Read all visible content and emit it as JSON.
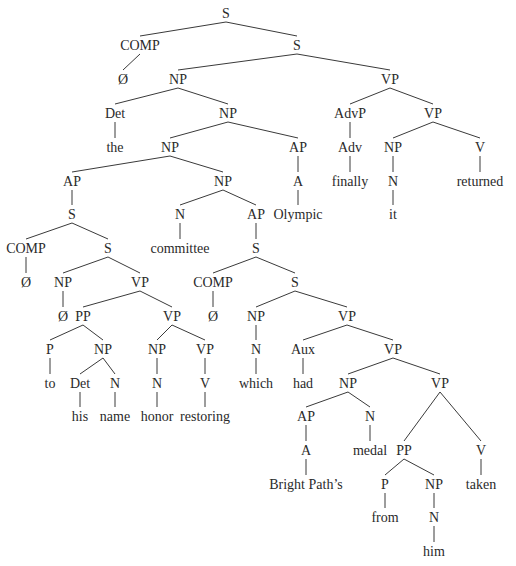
{
  "diagram": {
    "type": "syntax-tree",
    "nodes": [
      {
        "id": "n0",
        "label": "S",
        "x": 226,
        "y": 18
      },
      {
        "id": "n1",
        "label": "COMP",
        "x": 140,
        "y": 50,
        "parent": "n0"
      },
      {
        "id": "n2",
        "label": "Ø",
        "x": 123,
        "y": 84,
        "parent": "n1"
      },
      {
        "id": "n3",
        "label": "S",
        "x": 297,
        "y": 50,
        "parent": "n0"
      },
      {
        "id": "n4",
        "label": "NP",
        "x": 178,
        "y": 84,
        "parent": "n3"
      },
      {
        "id": "n5",
        "label": "VP",
        "x": 390,
        "y": 84,
        "parent": "n3"
      },
      {
        "id": "n6",
        "label": "Det",
        "x": 115,
        "y": 118,
        "parent": "n4"
      },
      {
        "id": "n7",
        "label": "the",
        "x": 115,
        "y": 152,
        "parent": "n6"
      },
      {
        "id": "n8",
        "label": "NP",
        "x": 228,
        "y": 118,
        "parent": "n4"
      },
      {
        "id": "n9",
        "label": "NP",
        "x": 170,
        "y": 152,
        "parent": "n8"
      },
      {
        "id": "n10",
        "label": "AP",
        "x": 298,
        "y": 152,
        "parent": "n8"
      },
      {
        "id": "n11",
        "label": "A",
        "x": 298,
        "y": 186,
        "parent": "n10"
      },
      {
        "id": "n12",
        "label": "Olympic",
        "x": 298,
        "y": 219,
        "parent": "n11"
      },
      {
        "id": "n13",
        "label": "AdvP",
        "x": 350,
        "y": 118,
        "parent": "n5"
      },
      {
        "id": "n14",
        "label": "Adv",
        "x": 350,
        "y": 152,
        "parent": "n13"
      },
      {
        "id": "n15",
        "label": "finally",
        "x": 350,
        "y": 186,
        "parent": "n14"
      },
      {
        "id": "n16",
        "label": "VP",
        "x": 433,
        "y": 118,
        "parent": "n5"
      },
      {
        "id": "n17",
        "label": "NP",
        "x": 393,
        "y": 152,
        "parent": "n16"
      },
      {
        "id": "n18",
        "label": "N",
        "x": 393,
        "y": 186,
        "parent": "n17"
      },
      {
        "id": "n19",
        "label": "it",
        "x": 393,
        "y": 219,
        "parent": "n18"
      },
      {
        "id": "n20",
        "label": "V",
        "x": 480,
        "y": 152,
        "parent": "n16"
      },
      {
        "id": "n21",
        "label": "returned",
        "x": 480,
        "y": 186,
        "parent": "n20"
      },
      {
        "id": "n22",
        "label": "AP",
        "x": 72,
        "y": 186,
        "parent": "n9"
      },
      {
        "id": "n23",
        "label": "S",
        "x": 72,
        "y": 219,
        "parent": "n22"
      },
      {
        "id": "n24",
        "label": "NP",
        "x": 223,
        "y": 186,
        "parent": "n9"
      },
      {
        "id": "n25",
        "label": "COMP",
        "x": 26,
        "y": 253,
        "parent": "n23"
      },
      {
        "id": "n26",
        "label": "Ø",
        "x": 26,
        "y": 287,
        "parent": "n25"
      },
      {
        "id": "n27",
        "label": "S",
        "x": 108,
        "y": 253,
        "parent": "n23"
      },
      {
        "id": "n28",
        "label": "N",
        "x": 180,
        "y": 219,
        "parent": "n24"
      },
      {
        "id": "n29",
        "label": "committee",
        "x": 180,
        "y": 253,
        "parent": "n28"
      },
      {
        "id": "n30",
        "label": "AP",
        "x": 256,
        "y": 219,
        "parent": "n24"
      },
      {
        "id": "n31",
        "label": "S",
        "x": 256,
        "y": 253,
        "parent": "n30"
      },
      {
        "id": "n32",
        "label": "NP",
        "x": 63,
        "y": 287,
        "parent": "n27"
      },
      {
        "id": "n33",
        "label": "Ø",
        "x": 63,
        "y": 321,
        "parent": "n32"
      },
      {
        "id": "n34",
        "label": "VP",
        "x": 140,
        "y": 287,
        "parent": "n27"
      },
      {
        "id": "n35",
        "label": "PP",
        "x": 83,
        "y": 321,
        "parent": "n34"
      },
      {
        "id": "n36",
        "label": "VP",
        "x": 172,
        "y": 321,
        "parent": "n34"
      },
      {
        "id": "n37",
        "label": "P",
        "x": 50,
        "y": 354,
        "parent": "n35"
      },
      {
        "id": "n38",
        "label": "to",
        "x": 50,
        "y": 388,
        "parent": "n37"
      },
      {
        "id": "n39",
        "label": "NP",
        "x": 103,
        "y": 354,
        "parent": "n35"
      },
      {
        "id": "n40",
        "label": "Det",
        "x": 80,
        "y": 388,
        "parent": "n39"
      },
      {
        "id": "n41",
        "label": "his",
        "x": 80,
        "y": 421,
        "parent": "n40"
      },
      {
        "id": "n42",
        "label": "N",
        "x": 115,
        "y": 388,
        "parent": "n39"
      },
      {
        "id": "n43",
        "label": "name",
        "x": 115,
        "y": 421,
        "parent": "n42"
      },
      {
        "id": "n44",
        "label": "NP",
        "x": 157,
        "y": 354,
        "parent": "n36"
      },
      {
        "id": "n45",
        "label": "N",
        "x": 157,
        "y": 388,
        "parent": "n44"
      },
      {
        "id": "n46",
        "label": "honor",
        "x": 157,
        "y": 421,
        "parent": "n45"
      },
      {
        "id": "n47",
        "label": "VP",
        "x": 205,
        "y": 354,
        "parent": "n36"
      },
      {
        "id": "n48",
        "label": "V",
        "x": 205,
        "y": 388,
        "parent": "n47"
      },
      {
        "id": "n49",
        "label": "restoring",
        "x": 205,
        "y": 421,
        "parent": "n48"
      },
      {
        "id": "n50",
        "label": "COMP",
        "x": 213,
        "y": 287,
        "parent": "n31"
      },
      {
        "id": "n51",
        "label": "Ø",
        "x": 213,
        "y": 321,
        "parent": "n50"
      },
      {
        "id": "n52",
        "label": "S",
        "x": 295,
        "y": 287,
        "parent": "n31"
      },
      {
        "id": "n53",
        "label": "NP",
        "x": 256,
        "y": 321,
        "parent": "n52"
      },
      {
        "id": "n54",
        "label": "N",
        "x": 256,
        "y": 354,
        "parent": "n53"
      },
      {
        "id": "n55",
        "label": "which",
        "x": 256,
        "y": 388,
        "parent": "n54"
      },
      {
        "id": "n56",
        "label": "VP",
        "x": 347,
        "y": 321,
        "parent": "n52"
      },
      {
        "id": "n57",
        "label": "Aux",
        "x": 303,
        "y": 354,
        "parent": "n56"
      },
      {
        "id": "n58",
        "label": "had",
        "x": 303,
        "y": 388,
        "parent": "n57"
      },
      {
        "id": "n59",
        "label": "VP",
        "x": 393,
        "y": 354,
        "parent": "n56"
      },
      {
        "id": "n60",
        "label": "NP",
        "x": 348,
        "y": 388,
        "parent": "n59"
      },
      {
        "id": "n61",
        "label": "AP",
        "x": 306,
        "y": 421,
        "parent": "n60"
      },
      {
        "id": "n62",
        "label": "A",
        "x": 306,
        "y": 455,
        "parent": "n61"
      },
      {
        "id": "n63",
        "label": "Bright Path’s",
        "x": 306,
        "y": 489,
        "parent": "n62"
      },
      {
        "id": "n64",
        "label": "N",
        "x": 370,
        "y": 421,
        "parent": "n60"
      },
      {
        "id": "n65",
        "label": "medal",
        "x": 370,
        "y": 455,
        "parent": "n64"
      },
      {
        "id": "n66",
        "label": "VP",
        "x": 440,
        "y": 388,
        "parent": "n59"
      },
      {
        "id": "n67",
        "label": "PP",
        "x": 404,
        "y": 455,
        "parent": "n66"
      },
      {
        "id": "n68",
        "label": "V",
        "x": 481,
        "y": 455,
        "parent": "n66"
      },
      {
        "id": "n69",
        "label": "taken",
        "x": 481,
        "y": 489,
        "parent": "n68"
      },
      {
        "id": "n70",
        "label": "P",
        "x": 385,
        "y": 489,
        "parent": "n67"
      },
      {
        "id": "n71",
        "label": "from",
        "x": 385,
        "y": 522,
        "parent": "n70"
      },
      {
        "id": "n72",
        "label": "NP",
        "x": 434,
        "y": 489,
        "parent": "n67"
      },
      {
        "id": "n73",
        "label": "N",
        "x": 434,
        "y": 522,
        "parent": "n72"
      },
      {
        "id": "n74",
        "label": "him",
        "x": 434,
        "y": 556,
        "parent": "n73"
      }
    ]
  }
}
